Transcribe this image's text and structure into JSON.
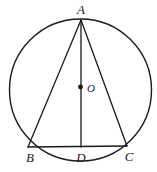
{
  "diagram": {
    "kind": "circle-geometry",
    "background_color": "#ffffff",
    "stroke_color": "#1a1a1a",
    "labels": {
      "apex": "A",
      "left_base": "B",
      "foot": "D",
      "right_base": "C",
      "center": "O"
    },
    "circle": {
      "name": "circumscribed-circle",
      "cx": 80.5,
      "cy": 90,
      "r": 71,
      "stroke_width": 1.4
    },
    "center_dot": {
      "name": "center-point-O",
      "cx": 80.5,
      "cy": 87,
      "r": 2.4
    },
    "points": {
      "A": {
        "x": 81,
        "y": 20
      },
      "B": {
        "x": 28,
        "y": 147
      },
      "D": {
        "x": 81,
        "y": 147
      },
      "C": {
        "x": 127,
        "y": 146
      }
    },
    "segments": [
      {
        "name": "segment-AB",
        "x1": 81,
        "y1": 20,
        "x2": 28,
        "y2": 147
      },
      {
        "name": "segment-AC",
        "x1": 81,
        "y1": 20,
        "x2": 127,
        "y2": 146
      },
      {
        "name": "segment-BC",
        "x1": 28,
        "y1": 147,
        "x2": 127,
        "y2": 146
      },
      {
        "name": "segment-AD",
        "x1": 81,
        "y1": 20,
        "x2": 81,
        "y2": 147
      }
    ],
    "label_positions": {
      "A": {
        "x": 81,
        "y": 14,
        "anchor": "middle"
      },
      "B": {
        "x": 30,
        "y": 162,
        "anchor": "middle"
      },
      "D": {
        "x": 81,
        "y": 162,
        "anchor": "middle"
      },
      "C": {
        "x": 129,
        "y": 161,
        "anchor": "middle"
      },
      "O": {
        "x": 87,
        "y": 92,
        "anchor": "start"
      }
    }
  }
}
